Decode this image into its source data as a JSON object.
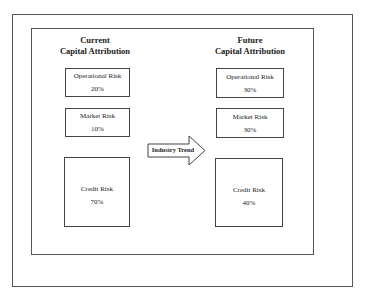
{
  "current": {
    "title_line1": "Current",
    "title_line2": "Capital Attribution",
    "boxes": [
      {
        "label": "Operational Risk",
        "value": "20%"
      },
      {
        "label": "Market Risk",
        "value": "10%"
      },
      {
        "label": "Credit Risk",
        "value": "70%"
      }
    ]
  },
  "arrow": {
    "label": "Industry Trend"
  },
  "future": {
    "title_line1": "Future",
    "title_line2": "Capital Attribution",
    "boxes": [
      {
        "label": "Operational Risk",
        "value": "30%"
      },
      {
        "label": "Market Risk",
        "value": "30%"
      },
      {
        "label": "Credit Risk",
        "value": "40%"
      }
    ]
  }
}
